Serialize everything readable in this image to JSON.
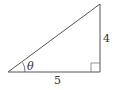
{
  "diagram": {
    "type": "right-triangle",
    "labels": {
      "opposite": "4",
      "adjacent": "5",
      "angle": "θ"
    },
    "vertices": {
      "angle_vertex": [
        8,
        72
      ],
      "right_angle_vertex": [
        100,
        72
      ],
      "top_vertex": [
        100,
        4
      ]
    },
    "colors": {
      "stroke": "#555555",
      "text": "#333333"
    }
  }
}
